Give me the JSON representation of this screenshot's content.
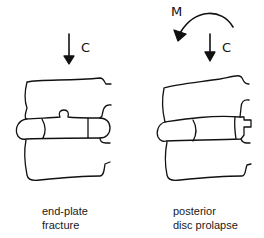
{
  "diagram": {
    "panels": [
      {
        "id": "left",
        "force_labels": [
          "C"
        ],
        "caption_lines": [
          "end-plate",
          "fracture"
        ]
      },
      {
        "id": "right",
        "force_labels": [
          "M",
          "C"
        ],
        "caption_lines": [
          "posterior",
          "disc prolapse"
        ]
      }
    ],
    "colors": {
      "line": "#111111",
      "background": "#ffffff"
    }
  }
}
